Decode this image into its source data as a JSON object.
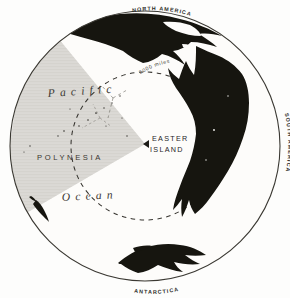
{
  "figure": {
    "kind": "hemisphere-map",
    "background_color": "#fdfdfc",
    "ink_color": "#1c1b18",
    "land_color": "#16150f",
    "wedge_color": "#d7d5d1",
    "outline_color": "#3a3832"
  },
  "globe": {
    "center_x": 145,
    "center_y": 146,
    "radius": 136
  },
  "labels": {
    "ocean_word1": "Pacific",
    "ocean_word2": "Ocean",
    "region": "POLYNESIA",
    "focus_line1": "EASTER",
    "focus_line2": "ISLAND",
    "scale_ring": "2000 miles"
  },
  "continents": [
    {
      "name": "NORTH AMERICA",
      "position": "top"
    },
    {
      "name": "SOUTH AMERICA",
      "position": "right"
    },
    {
      "name": "ANTARCTICA",
      "position": "bottom"
    }
  ],
  "rings": {
    "distance_ring_label": "2000 miles",
    "distance_ring_radius_px": 74,
    "style": "dashed"
  },
  "wedge": {
    "apex_x": 145,
    "apex_y": 144,
    "start_angle_deg": 150,
    "end_angle_deg": 272,
    "shaded": true
  }
}
